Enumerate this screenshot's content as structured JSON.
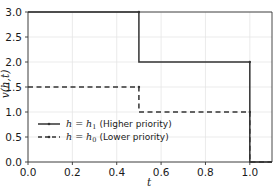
{
  "chart_data": {
    "type": "line",
    "title": "",
    "xlabel": "t",
    "ylabel": "v(h,t)",
    "xlim": [
      0.0,
      1.1
    ],
    "ylim": [
      0.0,
      3.0
    ],
    "grid": true,
    "legend_position": "lower left",
    "xticks": [
      "0.0",
      "0.2",
      "0.4",
      "0.6",
      "0.8",
      "1.0"
    ],
    "xtick_values": [
      0.0,
      0.2,
      0.4,
      0.6,
      0.8,
      1.0
    ],
    "yticks": [
      "0.0",
      "0.5",
      "1.0",
      "1.5",
      "2.0",
      "2.5",
      "3.0"
    ],
    "ytick_values": [
      0.0,
      0.5,
      1.0,
      1.5,
      2.0,
      2.5,
      3.0
    ],
    "series": [
      {
        "name": "h = h_1 (Higher priority)",
        "legend_math": "h = h",
        "legend_sub": "1",
        "legend_note": "(Higher priority)",
        "style": "solid",
        "color": "#333333",
        "marker": "dot",
        "x": [
          0.0,
          0.5,
          0.5,
          1.0,
          1.0,
          1.1
        ],
        "y": [
          3.0,
          3.0,
          2.0,
          2.0,
          0.0,
          0.0
        ]
      },
      {
        "name": "h = h_0 (Lower priority)",
        "legend_math": "h = h",
        "legend_sub": "0",
        "legend_note": "(Lower priority)",
        "style": "dashed",
        "color": "#333333",
        "marker": "dot",
        "x": [
          0.0,
          0.5,
          0.5,
          1.0,
          1.0,
          1.1
        ],
        "y": [
          1.5,
          1.5,
          1.0,
          1.0,
          0.0,
          0.0
        ]
      }
    ],
    "colors": {
      "axis": "#333333",
      "grid": "#e6e6e6",
      "background": "#ffffff",
      "text": "#1a1a1a"
    }
  }
}
